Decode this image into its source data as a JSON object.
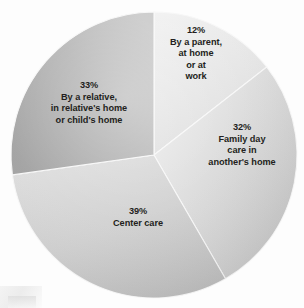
{
  "chart_data": {
    "type": "pie",
    "title": "",
    "subtitle": "",
    "xlabel": "",
    "ylabel": "",
    "legend_position": "none",
    "grid": false,
    "labels_inside": true,
    "categories": [
      "By a parent, at home or at work",
      "Family day care in another's home",
      "Center care",
      "By a relative, in relative's home or child's home"
    ],
    "values": [
      12,
      32,
      39,
      33
    ],
    "value_suffix": "%",
    "slices": [
      {
        "id": "parent",
        "percent_label": "12%",
        "value": 12,
        "lines": [
          "By a parent,",
          "at home",
          "or at",
          "work"
        ],
        "color": "#e6e6e6",
        "color_light": "#f4f4f4",
        "color_dark": "#d2d2d2",
        "start_angle_deg": 0,
        "end_angle_deg": 52
      },
      {
        "id": "family-day-care",
        "percent_label": "32%",
        "value": 32,
        "lines": [
          "Family day",
          "care in",
          "another's home"
        ],
        "color": "#d9d9d9",
        "color_light": "#ebebeb",
        "color_dark": "#c0c0c0",
        "start_angle_deg": 52,
        "end_angle_deg": 150
      },
      {
        "id": "center-care",
        "percent_label": "39%",
        "value": 39,
        "lines": [
          "Center care"
        ],
        "color": "#cdcdcd",
        "color_light": "#dedede",
        "color_dark": "#b6b6b6",
        "start_angle_deg": 150,
        "end_angle_deg": 262
      },
      {
        "id": "relative",
        "percent_label": "33%",
        "value": 33,
        "lines": [
          "By a relative,",
          "in relative's home",
          "or child's home"
        ],
        "color": "#b2b2b2",
        "color_light": "#c9c9c9",
        "color_dark": "#9a9a9a",
        "start_angle_deg": 262,
        "end_angle_deg": 360
      }
    ],
    "geometry": {
      "center_x": 154,
      "center_y": 155,
      "radius": 143
    }
  },
  "labels": {
    "parent": {
      "percent": "12%",
      "line1": "By a parent,",
      "line2": "at home",
      "line3": "or at",
      "line4": "work"
    },
    "family_day_care": {
      "percent": "32%",
      "line1": "Family day",
      "line2": "care in",
      "line3": "another's home"
    },
    "relative": {
      "percent": "33%",
      "line1": "By a relative,",
      "line2": "in relative's home",
      "line3": "or child's home"
    },
    "center_care": {
      "percent": "39%",
      "line1": "Center care"
    }
  },
  "colors": {
    "background": "#fdfdfd",
    "text": "#231f20",
    "slice_parent": "#e6e6e6",
    "slice_family_day_care": "#d9d9d9",
    "slice_center_care": "#cdcdcd",
    "slice_relative": "#b2b2b2",
    "divider": "#f7f7f7"
  }
}
